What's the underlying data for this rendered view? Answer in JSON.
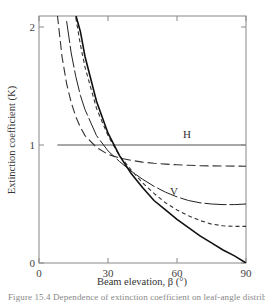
{
  "chart_data": {
    "type": "line",
    "title": "",
    "xlabel": "Beam elevation, β (°)",
    "ylabel": "Extinction coefficient (K)",
    "xlim": [
      0,
      90
    ],
    "ylim": [
      0,
      2.1
    ],
    "x_ticks": [
      0,
      30,
      60,
      90
    ],
    "y_ticks": [
      0,
      1,
      2
    ],
    "grid": false,
    "legend": null,
    "annotations": [
      {
        "text": "H",
        "x": 60,
        "y": 1.06
      },
      {
        "text": "V",
        "x": 60,
        "y": 0.55
      }
    ],
    "x": [
      8,
      10,
      12,
      14,
      16,
      18,
      20,
      25,
      30,
      35,
      40,
      45,
      50,
      55,
      60,
      65,
      70,
      75,
      80,
      85,
      90
    ],
    "series": [
      {
        "name": "H (horizontal leaves)",
        "style": "solid-gray",
        "values": [
          1,
          1,
          1,
          1,
          1,
          1,
          1,
          1,
          1,
          1,
          1,
          1,
          1,
          1,
          1,
          1,
          1,
          1,
          1,
          1,
          1
        ]
      },
      {
        "name": "long dash",
        "style": "long-dash",
        "values": [
          2.1,
          1.75,
          1.52,
          1.36,
          1.24,
          1.15,
          1.08,
          0.98,
          0.92,
          0.89,
          0.87,
          0.855,
          0.845,
          0.838,
          0.832,
          0.828,
          0.825,
          0.823,
          0.822,
          0.821,
          0.82
        ]
      },
      {
        "name": "thin solid / long-short dash",
        "style": "dash-long",
        "values": [
          null,
          null,
          2.05,
          1.78,
          1.58,
          1.42,
          1.3,
          1.08,
          0.95,
          0.86,
          0.78,
          0.71,
          0.65,
          0.6,
          0.56,
          0.53,
          0.51,
          0.5,
          0.495,
          0.495,
          0.5
        ]
      },
      {
        "name": "short dash",
        "style": "short-dash",
        "values": [
          null,
          null,
          null,
          null,
          2.08,
          1.85,
          1.66,
          1.31,
          1.08,
          0.91,
          0.79,
          0.68,
          0.59,
          0.51,
          0.45,
          0.4,
          0.36,
          0.33,
          0.315,
          0.31,
          0.31
        ]
      },
      {
        "name": "V (vertical leaves)",
        "style": "solid-heavy",
        "values": [
          null,
          null,
          null,
          null,
          2.1,
          1.96,
          1.75,
          1.37,
          1.1,
          0.91,
          0.76,
          0.64,
          0.53,
          0.45,
          0.37,
          0.3,
          0.23,
          0.17,
          0.11,
          0.06,
          0
        ]
      }
    ]
  },
  "figure": {
    "caption": "Figure 15.4  Dependence of extinction coefficient on leaf-angle distribution"
  }
}
